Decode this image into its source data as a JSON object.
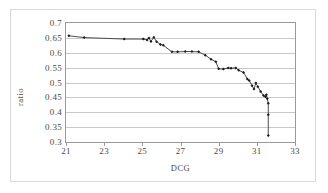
{
  "chart_data": {
    "type": "line",
    "title": "",
    "xlabel": "DCG",
    "ylabel": "ratio",
    "xlim": [
      21,
      33
    ],
    "ylim": [
      0.3,
      0.7
    ],
    "xticks": [
      21,
      23,
      25,
      27,
      29,
      31,
      33
    ],
    "xtick_labels": [
      "21",
      "23",
      "25",
      "27",
      "29",
      "31",
      "33"
    ],
    "yticks": [
      0.3,
      0.35,
      0.4,
      0.45,
      0.5,
      0.55,
      0.6,
      0.65,
      0.7
    ],
    "ytick_labels": [
      "0.3",
      "0.35",
      "0.4",
      "0.45",
      "0.5",
      "0.55",
      "0.6",
      "0.65",
      "0.7"
    ],
    "grid": "horizontal",
    "legend": "none",
    "marker": "diamond",
    "line_color": "#3a3a3a",
    "marker_color": "#1a1a1a",
    "grid_color": "#c8c8c8",
    "axis_color": "#9a9a9a",
    "series": [
      {
        "name": "ratio",
        "points": [
          [
            21.15,
            0.657
          ],
          [
            21.95,
            0.651
          ],
          [
            24.05,
            0.646
          ],
          [
            25.05,
            0.646
          ],
          [
            25.25,
            0.643
          ],
          [
            25.35,
            0.65
          ],
          [
            25.45,
            0.638
          ],
          [
            25.6,
            0.652
          ],
          [
            25.75,
            0.637
          ],
          [
            25.95,
            0.628
          ],
          [
            26.1,
            0.625
          ],
          [
            26.55,
            0.603
          ],
          [
            26.85,
            0.603
          ],
          [
            27.25,
            0.604
          ],
          [
            27.6,
            0.604
          ],
          [
            27.95,
            0.603
          ],
          [
            28.3,
            0.592
          ],
          [
            28.6,
            0.578
          ],
          [
            28.85,
            0.57
          ],
          [
            29.0,
            0.546
          ],
          [
            29.25,
            0.545
          ],
          [
            29.5,
            0.549
          ],
          [
            29.65,
            0.548
          ],
          [
            29.9,
            0.549
          ],
          [
            30.05,
            0.541
          ],
          [
            30.3,
            0.534
          ],
          [
            30.5,
            0.512
          ],
          [
            30.6,
            0.507
          ],
          [
            30.75,
            0.489
          ],
          [
            30.85,
            0.478
          ],
          [
            30.95,
            0.498
          ],
          [
            31.05,
            0.486
          ],
          [
            31.2,
            0.47
          ],
          [
            31.35,
            0.456
          ],
          [
            31.45,
            0.452
          ],
          [
            31.5,
            0.459
          ],
          [
            31.55,
            0.445
          ],
          [
            31.6,
            0.43
          ],
          [
            31.6,
            0.392
          ],
          [
            31.6,
            0.322
          ]
        ]
      }
    ]
  }
}
